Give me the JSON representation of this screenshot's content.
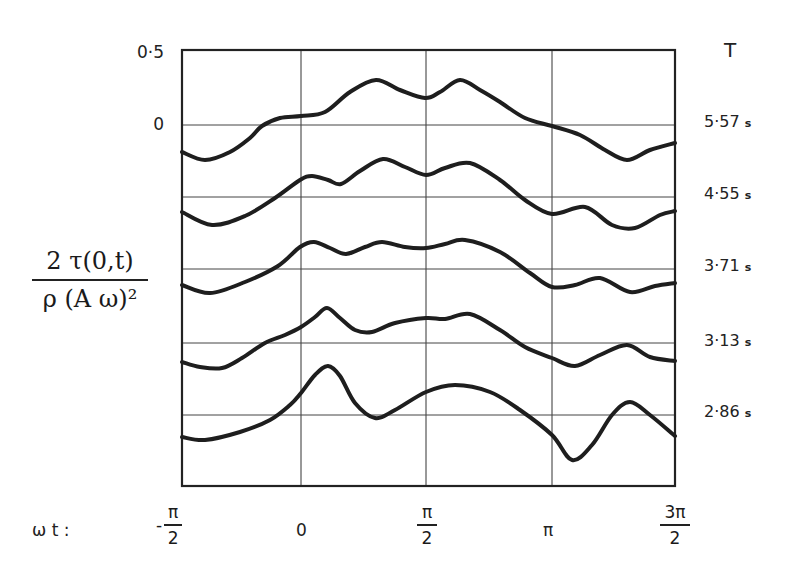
{
  "chart_data": {
    "type": "line",
    "title": "",
    "xlabel": "ωt",
    "ylabel": "2 τ(0,t) / ρ(Aω)²",
    "x_ticks": [
      "-π/2",
      "0",
      "π/2",
      "π",
      "3π/2"
    ],
    "x_range": [
      -1.5708,
      4.7124
    ],
    "y_ticks_labeled": [
      "0.5",
      "0"
    ],
    "y_scale_note": "each curve offset vertically; gridline spacing = 0.5 units",
    "legend_title": "T",
    "grid": true,
    "series": [
      {
        "name": "5.57 s",
        "label": "5·57",
        "unit": "s",
        "x": [
          -1.5708,
          -1.178,
          -0.785,
          -0.393,
          0,
          0.393,
          0.785,
          1.178,
          1.5708,
          1.963,
          2.356,
          2.749,
          3.1416,
          3.534,
          3.927,
          4.32,
          4.7124
        ],
        "values": [
          -0.19,
          -0.24,
          -0.12,
          0.03,
          0.07,
          0.12,
          0.32,
          0.22,
          0.19,
          0.31,
          0.15,
          0.03,
          -0.02,
          -0.12,
          -0.24,
          -0.17,
          -0.13
        ]
      },
      {
        "name": "4.55 s",
        "label": "4·55",
        "unit": "s",
        "x": [
          -1.5708,
          -1.178,
          -0.785,
          -0.393,
          0,
          0.393,
          0.785,
          1.178,
          1.5708,
          1.963,
          2.356,
          2.749,
          3.1416,
          3.534,
          3.927,
          4.32,
          4.7124
        ],
        "values": [
          -0.1,
          -0.19,
          -0.12,
          0.0,
          0.12,
          0.09,
          0.26,
          0.18,
          0.15,
          0.23,
          0.12,
          -0.06,
          -0.12,
          -0.07,
          -0.2,
          -0.17,
          -0.1
        ]
      },
      {
        "name": "3.71 s",
        "label": "3·71",
        "unit": "s",
        "x": [
          -1.5708,
          -1.178,
          -0.785,
          -0.393,
          0,
          0.393,
          0.785,
          1.178,
          1.5708,
          1.963,
          2.356,
          2.749,
          3.1416,
          3.534,
          3.927,
          4.32,
          4.7124
        ],
        "values": [
          -0.12,
          -0.17,
          -0.08,
          0.01,
          0.15,
          0.1,
          0.18,
          0.14,
          0.15,
          0.2,
          0.12,
          -0.02,
          -0.13,
          -0.06,
          -0.16,
          -0.1,
          -0.1
        ]
      },
      {
        "name": "3.13 s",
        "label": "3·13",
        "unit": "s",
        "x": [
          -1.5708,
          -1.178,
          -0.785,
          -0.393,
          0,
          0.393,
          0.785,
          1.178,
          1.5708,
          1.963,
          2.356,
          2.749,
          3.1416,
          3.534,
          3.927,
          4.32,
          4.7124
        ],
        "values": [
          -0.13,
          -0.17,
          -0.08,
          0.04,
          0.1,
          0.24,
          0.08,
          0.14,
          0.17,
          0.2,
          0.09,
          -0.05,
          -0.1,
          -0.16,
          -0.04,
          -0.1,
          -0.13
        ]
      },
      {
        "name": "2.86 s",
        "label": "2·86",
        "unit": "s",
        "x": [
          -1.5708,
          -1.178,
          -0.785,
          -0.393,
          0,
          0.393,
          0.785,
          1.178,
          1.5708,
          1.963,
          2.356,
          2.749,
          3.1416,
          3.534,
          3.927,
          4.32,
          4.7124
        ],
        "values": [
          -0.15,
          -0.14,
          -0.05,
          0.05,
          0.14,
          0.3,
          0.0,
          0.04,
          0.17,
          0.2,
          0.16,
          0.01,
          -0.14,
          -0.3,
          0.0,
          0.04,
          -0.15
        ]
      }
    ]
  },
  "plot": {
    "box": {
      "x0": 182,
      "y0": 50,
      "x1": 675,
      "y1": 486
    },
    "v_grid_x": [
      301,
      426,
      552
    ],
    "h_grid_y": [
      125,
      197,
      269,
      343,
      415
    ],
    "curves": [
      {
        "name": "curve-5-57",
        "points": [
          [
            182,
            152
          ],
          [
            205,
            160
          ],
          [
            230,
            152
          ],
          [
            250,
            138
          ],
          [
            262,
            126
          ],
          [
            280,
            118
          ],
          [
            301,
            116
          ],
          [
            325,
            112
          ],
          [
            350,
            92
          ],
          [
            376,
            80
          ],
          [
            400,
            90
          ],
          [
            425,
            98
          ],
          [
            440,
            92
          ],
          [
            460,
            80
          ],
          [
            480,
            90
          ],
          [
            500,
            102
          ],
          [
            525,
            118
          ],
          [
            552,
            126
          ],
          [
            580,
            135
          ],
          [
            605,
            150
          ],
          [
            627,
            160
          ],
          [
            650,
            150
          ],
          [
            675,
            143
          ]
        ]
      },
      {
        "name": "curve-4-55",
        "points": [
          [
            182,
            212
          ],
          [
            212,
            225
          ],
          [
            245,
            216
          ],
          [
            275,
            198
          ],
          [
            300,
            180
          ],
          [
            312,
            176
          ],
          [
            328,
            180
          ],
          [
            341,
            184
          ],
          [
            360,
            171
          ],
          [
            383,
            159
          ],
          [
            405,
            167
          ],
          [
            426,
            175
          ],
          [
            445,
            168
          ],
          [
            470,
            163
          ],
          [
            500,
            180
          ],
          [
            525,
            200
          ],
          [
            552,
            214
          ],
          [
            585,
            207
          ],
          [
            612,
            225
          ],
          [
            635,
            228
          ],
          [
            660,
            215
          ],
          [
            675,
            211
          ]
        ]
      },
      {
        "name": "curve-3-71",
        "points": [
          [
            182,
            285
          ],
          [
            210,
            293
          ],
          [
            245,
            282
          ],
          [
            278,
            266
          ],
          [
            300,
            247
          ],
          [
            314,
            242
          ],
          [
            330,
            248
          ],
          [
            346,
            254
          ],
          [
            365,
            247
          ],
          [
            382,
            242
          ],
          [
            405,
            247
          ],
          [
            426,
            248
          ],
          [
            445,
            244
          ],
          [
            465,
            240
          ],
          [
            500,
            252
          ],
          [
            530,
            273
          ],
          [
            552,
            287
          ],
          [
            575,
            285
          ],
          [
            600,
            278
          ],
          [
            630,
            292
          ],
          [
            655,
            286
          ],
          [
            675,
            283
          ]
        ]
      },
      {
        "name": "curve-3-13",
        "points": [
          [
            182,
            362
          ],
          [
            200,
            367
          ],
          [
            222,
            368
          ],
          [
            242,
            358
          ],
          [
            265,
            343
          ],
          [
            285,
            335
          ],
          [
            301,
            327
          ],
          [
            315,
            317
          ],
          [
            327,
            308
          ],
          [
            340,
            318
          ],
          [
            355,
            330
          ],
          [
            372,
            332
          ],
          [
            395,
            323
          ],
          [
            426,
            318
          ],
          [
            445,
            319
          ],
          [
            470,
            314
          ],
          [
            500,
            330
          ],
          [
            525,
            347
          ],
          [
            552,
            358
          ],
          [
            575,
            366
          ],
          [
            600,
            355
          ],
          [
            627,
            345
          ],
          [
            650,
            357
          ],
          [
            675,
            361
          ]
        ]
      },
      {
        "name": "curve-2-86",
        "points": [
          [
            182,
            437
          ],
          [
            205,
            440
          ],
          [
            240,
            432
          ],
          [
            270,
            420
          ],
          [
            290,
            405
          ],
          [
            301,
            393
          ],
          [
            315,
            375
          ],
          [
            328,
            366
          ],
          [
            340,
            376
          ],
          [
            355,
            403
          ],
          [
            375,
            418
          ],
          [
            395,
            410
          ],
          [
            426,
            392
          ],
          [
            455,
            385
          ],
          [
            490,
            392
          ],
          [
            520,
            410
          ],
          [
            552,
            435
          ],
          [
            572,
            460
          ],
          [
            592,
            445
          ],
          [
            612,
            415
          ],
          [
            630,
            402
          ],
          [
            650,
            415
          ],
          [
            675,
            436
          ]
        ]
      }
    ]
  },
  "labels": {
    "y_tick_05": "0·5",
    "y_tick_0": "0",
    "legend_title": "T",
    "series_labels": [
      {
        "value": "5·57",
        "unit": "s"
      },
      {
        "value": "4·55",
        "unit": "s"
      },
      {
        "value": "3·71",
        "unit": "s"
      },
      {
        "value": "3·13",
        "unit": "s"
      },
      {
        "value": "2·86",
        "unit": "s"
      }
    ],
    "ylabel_num": "2 τ(0,t)",
    "ylabel_den": "ρ (A ω)²",
    "xlabel": "ω t  :",
    "x_ticks": {
      "neg_half_pi": {
        "sign": "-",
        "num": "π",
        "den": "2"
      },
      "zero": "0",
      "half_pi": {
        "num": "π",
        "den": "2"
      },
      "pi": "π",
      "three_half_pi": {
        "num": "3π",
        "den": "2"
      }
    }
  }
}
